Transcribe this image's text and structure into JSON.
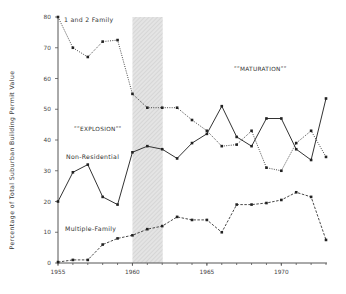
{
  "chart_data": {
    "type": "line",
    "title": "",
    "xlabel": "",
    "ylabel": "Percentage of Total Suburban Building Permit Value",
    "x": [
      1955,
      1956,
      1957,
      1958,
      1959,
      1960,
      1961,
      1962,
      1963,
      1964,
      1965,
      1966,
      1967,
      1968,
      1969,
      1970,
      1971,
      1972,
      1973
    ],
    "xlim": [
      1955,
      1973
    ],
    "ylim": [
      0,
      80
    ],
    "x_ticks": [
      1955,
      1960,
      1965,
      1970
    ],
    "y_ticks": [
      0,
      10,
      20,
      30,
      40,
      50,
      60,
      70,
      80
    ],
    "grid": false,
    "legend": "inline labels",
    "series": [
      {
        "name": "1 and 2 Family",
        "style": "dotted",
        "values": [
          80,
          70,
          67,
          72,
          72.5,
          55,
          50.5,
          50.5,
          50.5,
          46.5,
          43,
          38,
          38.5,
          43,
          31,
          30,
          39,
          43,
          34.5
        ]
      },
      {
        "name": "Non-Residential",
        "style": "solid",
        "values": [
          20,
          29.5,
          32,
          21.5,
          19,
          36,
          38,
          37,
          34,
          39,
          42,
          51,
          41,
          38,
          47,
          47,
          37,
          33.5,
          53.5
        ]
      },
      {
        "name": "Multiple-Family",
        "style": "dashed",
        "values": [
          0.3,
          1,
          1,
          6,
          8,
          9,
          11,
          12,
          15,
          14,
          14,
          10,
          19,
          19,
          19.5,
          20.5,
          23,
          21.5,
          7.5
        ]
      }
    ],
    "shaded_region": {
      "x_start": 1960,
      "x_end": 1962
    },
    "annotations": [
      {
        "text": "\"EXPLOSION\"",
        "x": 1958,
        "y": 43
      },
      {
        "text": "\"MATURATION\"",
        "x": 1967.5,
        "y": 63
      }
    ]
  },
  "labels": {
    "ylabel": "Percentage of Total Suburban Building Permit Value",
    "series_one_two_family": "1 and 2 Family",
    "series_non_residential": "Non-Residential",
    "series_multiple_family": "Multiple-Family",
    "explosion": "ʺʺEXPLOSIONʺʺ",
    "maturation": "ʺʺMATURATIONʺʺ"
  }
}
